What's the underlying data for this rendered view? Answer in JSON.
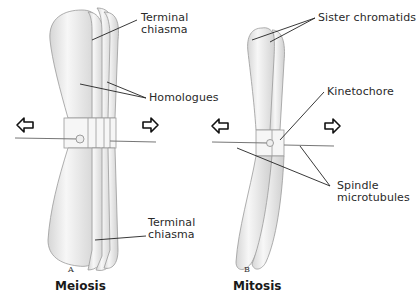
{
  "panels": [
    {
      "letter": "A",
      "title": "Meiosis",
      "labels": {
        "terminal_chiasma_top": [
          "Terminal",
          "chiasma"
        ],
        "homologues": "Homologues",
        "terminal_chiasma_bottom": [
          "Terminal",
          "chiasma"
        ]
      }
    },
    {
      "letter": "B",
      "title": "Mitosis",
      "labels": {
        "sister_chromatids": "Sister chromatids",
        "kinetochore": "Kinetochore",
        "spindle_microtubules": [
          "Spindle",
          "microtubules"
        ]
      }
    }
  ],
  "icons": {
    "arrow_left": "hollow-left-arrow",
    "arrow_right": "hollow-right-arrow"
  },
  "colors": {
    "chromosome_fill": "#f2f2f2",
    "chromosome_shade": "#c8c8c8",
    "outline": "#8a8a8a",
    "text": "#2a2a2a"
  }
}
